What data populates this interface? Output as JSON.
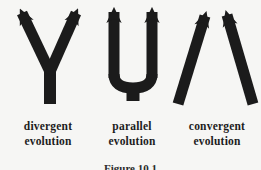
{
  "figure": {
    "items": [
      {
        "icon": "divergent-arrows-icon",
        "label_line1": "divergent",
        "label_line2": "evolution"
      },
      {
        "icon": "parallel-arrows-icon",
        "label_line1": "parallel",
        "label_line2": "evolution"
      },
      {
        "icon": "convergent-arrows-icon",
        "label_line1": "convergent",
        "label_line2": "evolution"
      }
    ],
    "caption": "Figure 10.1",
    "colors": {
      "ink": "#1b1b1b",
      "background": "#f6f6f4",
      "label_text": "#1d1d1d"
    }
  }
}
